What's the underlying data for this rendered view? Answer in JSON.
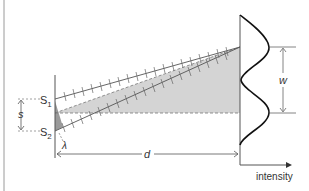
{
  "diagram": {
    "labels": {
      "source1": "S",
      "source1_sub": "1",
      "source2": "S",
      "source2_sub": "2",
      "separation": "s",
      "wavelength": "λ",
      "distance": "d",
      "fringe_width": "w",
      "intensity_axis": "intensity"
    },
    "colors": {
      "line": "#555555",
      "shade": "#d4d4d4",
      "dark_shade": "#9a9a9a",
      "curve": "#111111",
      "text": "#333333"
    }
  }
}
